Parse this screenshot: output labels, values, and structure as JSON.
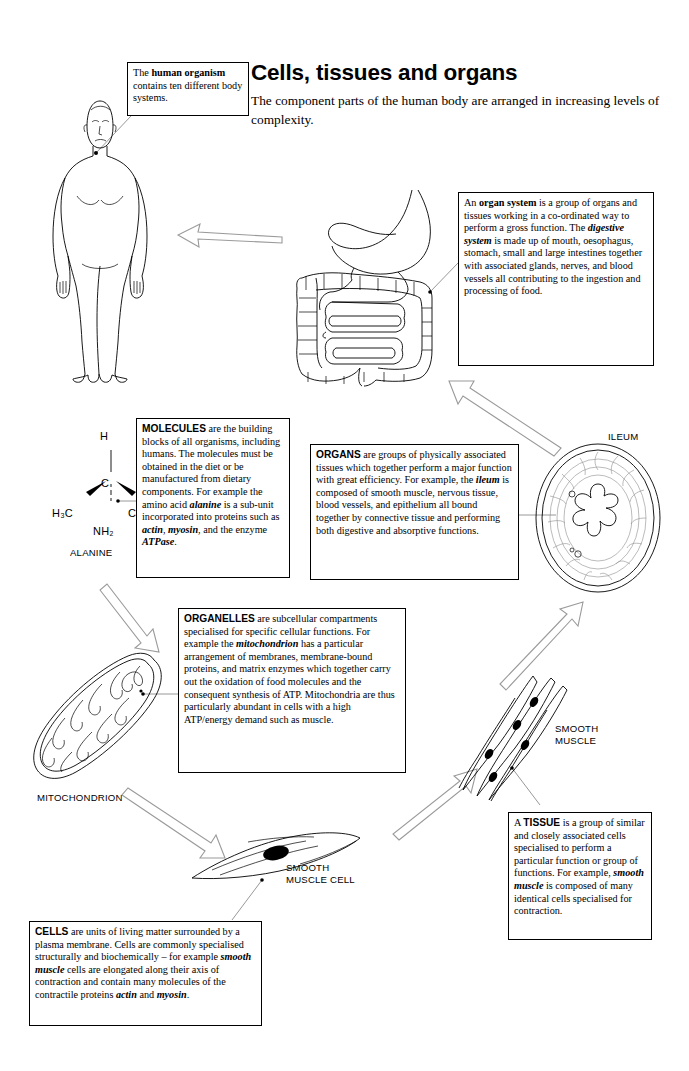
{
  "header": {
    "title": "Cells, tissues and organs",
    "subtitle": "The component parts of the human body are arranged in increasing levels of complexity."
  },
  "callouts": {
    "organism": {
      "name": "human-organism-callout",
      "text_parts": [
        "The ",
        "human organism",
        " contains ten different body systems."
      ],
      "plain": "The human organism contains ten different body systems."
    },
    "organ_system": {
      "name": "organ-system-callout",
      "plain": "An organ system is a group of organs and tissues working in a co-ordinated way to perform a gross function. The digestive system is made up of mouth, oesophagus, stomach, small and large intestines together with associated glands, nerves, and blood vessels all contributing to the ingestion and processing of food."
    },
    "molecules": {
      "name": "molecules-callout",
      "heading": "MOLECULES",
      "plain": "MOLECULES are the building blocks of all organisms, including humans. The molecules must be obtained in the diet or be manufactured from dietary components. For example the amino acid alanine is a sub-unit incorporated into proteins such as actin, myosin, and the enzyme ATPase."
    },
    "organs": {
      "name": "organs-callout",
      "heading": "ORGANS",
      "plain": "ORGANS are groups of physically associated tissues which together perform a major function with great efficiency. For example, the ileum is composed of smooth muscle, nervous tissue, blood vessels, and epithelium all bound together by connective tissue and performing both digestive and absorptive functions."
    },
    "organelles": {
      "name": "organelles-callout",
      "heading": "ORGANELLES",
      "plain": "ORGANELLES are subcellular compartments specialised for specific cellular functions. For example the mitochondrion has a particular arrangement of membranes, membrane-bound proteins, and matrix enzymes which together carry out the oxidation of food molecules and the consequent synthesis of ATP. Mitochondria are thus particularly abundant in cells with a high ATP/energy demand such as muscle."
    },
    "tissue": {
      "name": "tissue-callout",
      "heading": "TISSUE",
      "plain": "A TISSUE is a group of similar and closely associated cells specialised to perform a particular function or group of functions. For example, smooth muscle is composed of many identical cells specialised for contraction."
    },
    "cells": {
      "name": "cells-callout",
      "heading": "CELLS",
      "plain": "CELLS are units of living matter surrounded by a plasma membrane. Cells are commonly specialised structurally and biochemically – for example smooth muscle cells are elongated along their axis of contraction and contain many molecules of the contractile proteins actin and myosin."
    }
  },
  "labels": {
    "alanine": "ALANINE",
    "ileum": "ILEUM",
    "smooth_muscle_line1": "SMOOTH",
    "smooth_muscle_line2": "MUSCLE",
    "mitochondrion": "MITOCHONDRION",
    "smooth_muscle_cell_line1": "SMOOTH",
    "smooth_muscle_cell_line2": "MUSCLE CELL"
  },
  "molecule": {
    "name": "alanine-structure",
    "top": "H",
    "centre": "C",
    "left": "H₃C",
    "right": "COOH",
    "bottom": "NH₂"
  },
  "illustrations": [
    {
      "name": "human-body-figure",
      "caption": "standing human male outline"
    },
    {
      "name": "digestive-system-figure",
      "caption": "stomach, small and large intestine"
    },
    {
      "name": "ileum-cross-section-figure",
      "caption": "concentric rings with lobed lumen"
    },
    {
      "name": "smooth-muscle-tissue-figure",
      "caption": "bundle of spindle cells with nuclei"
    },
    {
      "name": "smooth-muscle-cell-figure",
      "caption": "single elongated cell with nucleus"
    },
    {
      "name": "mitochondrion-figure",
      "caption": "organelle with cristae"
    }
  ],
  "colors": {
    "ink": "#000000",
    "page": "#ffffff",
    "leader": "#7d7d7d",
    "arrow_stroke": "#9a9a9a"
  }
}
